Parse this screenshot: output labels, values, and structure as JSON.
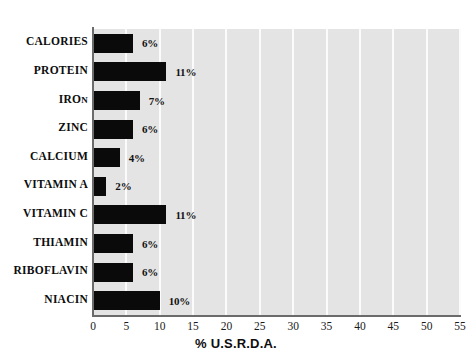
{
  "chart_data": {
    "type": "bar",
    "orientation": "horizontal",
    "title": "",
    "subtitle": "",
    "xlabel": "% U.S.R.D.A.",
    "ylabel": "",
    "xlim": [
      0,
      55
    ],
    "xticks": [
      "0",
      "5",
      "10",
      "15",
      "20",
      "25",
      "30",
      "35",
      "40",
      "45",
      "50",
      "55"
    ],
    "xtick_values": [
      0,
      5,
      10,
      15,
      20,
      25,
      30,
      35,
      40,
      45,
      50,
      55
    ],
    "grid": "vertical",
    "legend": "none",
    "categories": [
      "CALORIES",
      "PROTEIN",
      "IRON",
      "ZINC",
      "CALCIUM",
      "VITAMIN A",
      "VITAMIN C",
      "THIAMIN",
      "RIBOFLAVIN",
      "NIACIN"
    ],
    "values": [
      6,
      11,
      7,
      6,
      4,
      2,
      11,
      6,
      6,
      10
    ],
    "data_labels": [
      "6%",
      "11%",
      "7%",
      "6%",
      "4%",
      "2%",
      "11%",
      "6%",
      "6%",
      "10%"
    ],
    "bar_color": "#0a0a0a",
    "plot_background": "#e4e4e4",
    "gridline_color": "#fbfbfb",
    "axis_color": "#6b6b6b",
    "figure_background": "#ffffff"
  },
  "labels": {
    "iron_prefix": "IRO",
    "iron_smallcap": "N"
  }
}
